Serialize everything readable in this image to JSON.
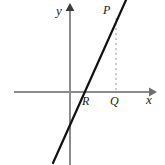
{
  "figure": {
    "width": 165,
    "height": 165,
    "background": "#ffffff"
  },
  "axes": {
    "color": "#8c8c8c",
    "stroke_width": 2,
    "x_axis": {
      "label": "x",
      "start_x": 14,
      "end_x": 155,
      "y": 92,
      "arrow": "right"
    },
    "y_axis": {
      "label": "y",
      "x": 70,
      "start_y": 8,
      "end_y": 165,
      "arrow": "up"
    }
  },
  "line": {
    "name": "diagonal-line",
    "color": "#111111",
    "stroke_width": 2.2,
    "x1": 53,
    "y1": 163,
    "x2": 126,
    "y2": 0,
    "x_intercept_px": 79,
    "y_intercept_px": 126
  },
  "dashed_segment": {
    "name": "pq-dashed-segment",
    "color": "#9a9a9a",
    "stroke_width": 1,
    "dash": "2 3",
    "x": 116,
    "y1": 18,
    "y2": 92
  },
  "labels": {
    "y_axis": "y",
    "x_axis": "x",
    "point_P": "P",
    "point_R": "R",
    "point_Q": "Q"
  },
  "chart_data": {
    "type": "line",
    "title": "",
    "xlabel": "x",
    "ylabel": "y",
    "grid": false,
    "legend": null,
    "annotations": [
      {
        "text": "P",
        "role": "point-on-line-upper-right"
      },
      {
        "text": "R",
        "role": "x-intercept-of-line"
      },
      {
        "text": "Q",
        "role": "foot-of-perpendicular-from-P-on-x-axis"
      }
    ],
    "series": [
      {
        "name": "line",
        "description": "straight line with positive slope crossing x-axis at R and passing through P"
      }
    ]
  }
}
